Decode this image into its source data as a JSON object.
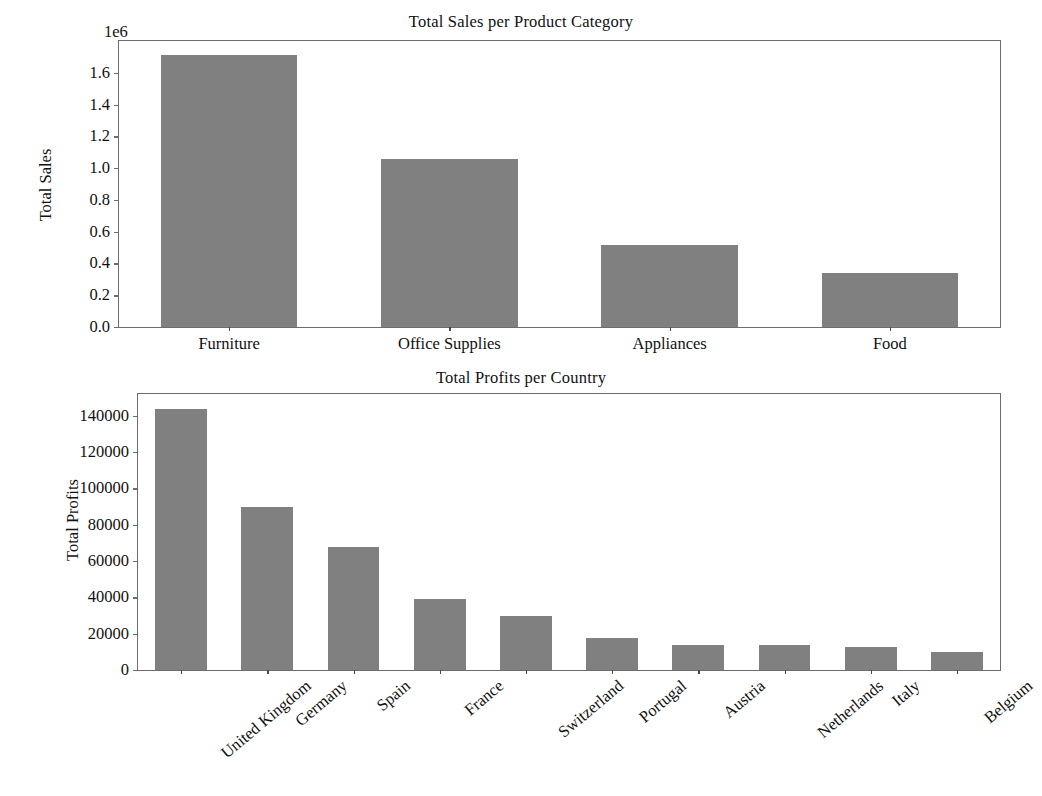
{
  "figure": {
    "background": "#ffffff",
    "bar_color": "#808080",
    "axis_color": "#6d6d6d",
    "width": 1042,
    "height": 796
  },
  "chart_data": [
    {
      "type": "bar",
      "title": "Total Sales per Product Category",
      "xlabel": "",
      "ylabel": "Total Sales",
      "offset_text": "1e6",
      "categories": [
        "Furniture",
        "Office Supplies",
        "Appliances",
        "Food"
      ],
      "values": [
        1710000,
        1060000,
        515000,
        340000
      ],
      "ylim": [
        0,
        1800000
      ],
      "yticks": [
        0,
        200000,
        400000,
        600000,
        800000,
        1000000,
        1200000,
        1400000,
        1600000
      ],
      "ytick_labels": [
        "0.0",
        "0.2",
        "0.4",
        "0.6",
        "0.8",
        "1.0",
        "1.2",
        "1.4",
        "1.6"
      ],
      "grid": false,
      "legend": null,
      "xtick_rotation": 0
    },
    {
      "type": "bar",
      "title": "Total Profits per Country",
      "xlabel": "",
      "ylabel": "Total Profits",
      "offset_text": "",
      "categories": [
        "United Kingdom",
        "Germany",
        "Spain",
        "France",
        "Switzerland",
        "Portugal",
        "Austria",
        "Netherlands",
        "Italy",
        "Belgium"
      ],
      "values": [
        144000,
        90000,
        67500,
        39000,
        30000,
        17500,
        13800,
        14000,
        12500,
        10000
      ],
      "ylim": [
        0,
        152000
      ],
      "yticks": [
        0,
        20000,
        40000,
        60000,
        80000,
        100000,
        120000,
        140000
      ],
      "ytick_labels": [
        "0",
        "20000",
        "40000",
        "60000",
        "80000",
        "100000",
        "120000",
        "140000"
      ],
      "grid": false,
      "legend": null,
      "xtick_rotation": 40
    }
  ]
}
